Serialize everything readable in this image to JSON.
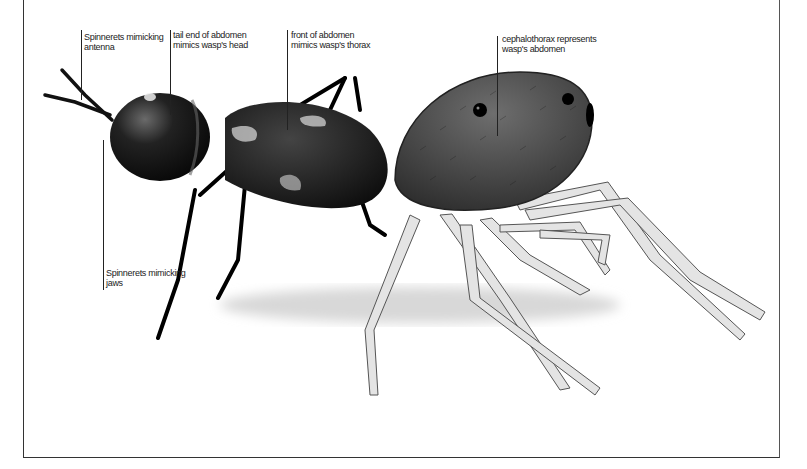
{
  "figure": {
    "labels": [
      {
        "id": "antenna",
        "lines": [
          "Spinnerets mimicking",
          "antenna"
        ]
      },
      {
        "id": "head",
        "lines": [
          "tail end of abdomen",
          "mimics wasp's head"
        ]
      },
      {
        "id": "thorax",
        "lines": [
          "front of abdomen",
          "mimics wasp's thorax"
        ]
      },
      {
        "id": "abdomen",
        "lines": [
          "cephalothorax represents",
          "wasp's abdomen"
        ]
      },
      {
        "id": "jaws",
        "lines": [
          "Spinnerets mimicking",
          "jaws"
        ]
      }
    ]
  }
}
